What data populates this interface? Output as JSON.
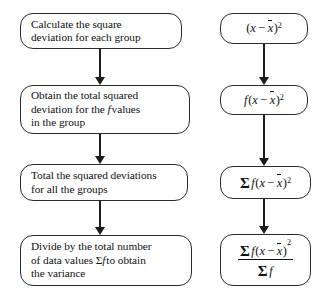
{
  "diagram": {
    "type": "flowchart",
    "orientation": "vertical",
    "columns": 2,
    "stroke_color": "#2b2b2b",
    "background_color": "#ffffff",
    "text_color": "#111111",
    "steps": [
      {
        "id": "step-1",
        "text": "Calculate the square\ndeviation for each group",
        "formula_plain": "(x − x̄)²"
      },
      {
        "id": "step-2",
        "text": "Obtain the total squared\ndeviation for the f values\nin the group",
        "formula_plain": "f(x − x̄)²"
      },
      {
        "id": "step-3",
        "text": "Total the squared deviations\nfor all the groups",
        "formula_plain": "Σ f(x − x̄)²"
      },
      {
        "id": "step-4",
        "text": "Divide by the total number\nof data values Σf to obtain\nthe variance",
        "formula_plain": "Σ f(x − x̄)² / Σ f"
      }
    ],
    "symbols": {
      "sigma": "Σ",
      "frequency": "f",
      "value": "x",
      "mean": "x̄",
      "minus": "−",
      "exponent": "2"
    },
    "connectors": [
      {
        "id": "connector-1",
        "from": "step-1",
        "to": "step-2",
        "marker": "arrow-down"
      },
      {
        "id": "connector-2",
        "from": "step-2",
        "to": "step-3",
        "marker": "arrow-down"
      },
      {
        "id": "connector-3",
        "from": "step-3",
        "to": "step-4",
        "marker": "arrow-down"
      },
      {
        "id": "connector-4",
        "from": "formula-1",
        "to": "formula-2",
        "marker": "arrow-down"
      },
      {
        "id": "connector-5",
        "from": "formula-2",
        "to": "formula-3",
        "marker": "arrow-down"
      },
      {
        "id": "connector-6",
        "from": "formula-3",
        "to": "formula-4",
        "marker": "arrow-down"
      }
    ]
  }
}
